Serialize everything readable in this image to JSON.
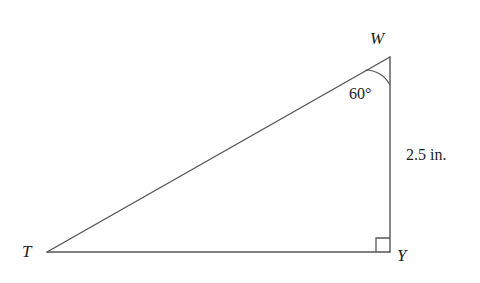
{
  "figure": {
    "type": "right-triangle-diagram",
    "stroke_color": "#55555a",
    "text_color": "#1d1d1f",
    "background_color": "#ffffff",
    "vertices": [
      {
        "name": "W",
        "label": "W",
        "x": 390,
        "y": 57
      },
      {
        "name": "T",
        "label": "T",
        "x": 47,
        "y": 252
      },
      {
        "name": "Y",
        "label": "Y",
        "x": 390,
        "y": 252
      }
    ],
    "sides": [
      {
        "name": "hypotenuse-TW",
        "from": "T",
        "to": "W",
        "label": ""
      },
      {
        "name": "leg-WY",
        "from": "W",
        "to": "Y",
        "label": "2.5 in."
      },
      {
        "name": "leg-TY",
        "from": "T",
        "to": "Y",
        "label": ""
      }
    ],
    "angles": [
      {
        "at": "W",
        "label": "60°",
        "measure": 60,
        "marker": "arc",
        "arc_radius": 28
      },
      {
        "at": "Y",
        "label": "",
        "measure": 90,
        "marker": "right-angle-square",
        "square_size": 14
      }
    ],
    "measurements": {
      "side_wy_length": "2.5 in.",
      "angle_w": "60°"
    }
  }
}
